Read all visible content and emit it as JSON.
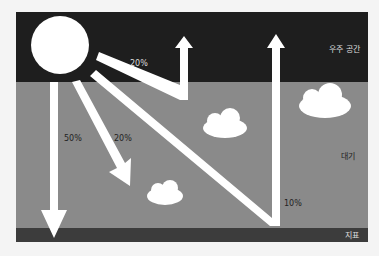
{
  "diagram": {
    "layers": {
      "space": "우주 공간",
      "atmosphere": "대기",
      "ground": "지표"
    },
    "arrows": {
      "reflected_space": "20%",
      "direct_ground": "50%",
      "to_clouds": "20%",
      "ground_reflect": "10%"
    },
    "colors": {
      "space": "#1e1e1e",
      "atmosphere": "#8a8a8a",
      "ground": "#3c3c3c",
      "sun": "#ffffff",
      "arrow": "#ffffff"
    }
  }
}
